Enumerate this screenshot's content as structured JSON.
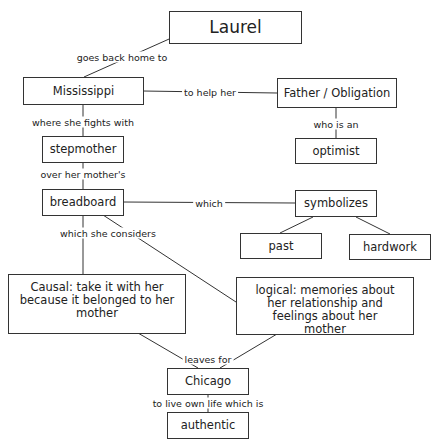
{
  "nodes": {
    "laurel": "Laurel",
    "mississippi": "Mississippi",
    "father": "Father / Obligation",
    "stepmother": "stepmother",
    "optimist": "optimist",
    "breadboard": "breadboard",
    "symbolizes": "symbolizes",
    "past": "past",
    "hardwork": "hardwork",
    "causal": "Causal: take it with her because it belonged to her mother",
    "logical": "logical: memories about her relationship and feelings about her mother",
    "chicago": "Chicago",
    "authentic": "authentic"
  },
  "links": {
    "goes_back": "goes back home to",
    "to_help": "to help her",
    "fights": "where she fights with",
    "who_is": "who is an",
    "over": "over her mother's",
    "which": "which",
    "considers": "which she considers",
    "leaves": "leaves for",
    "live_own": "to live own life which is"
  }
}
